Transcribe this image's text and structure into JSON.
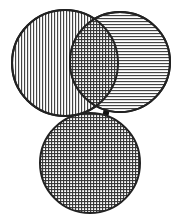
{
  "diagram": {
    "type": "venn-linked-circles",
    "colors": {
      "background": "#ffffff",
      "stroke": "#222222",
      "hatch": "#3a3a3a",
      "connector": "#111111"
    },
    "shapes": [
      {
        "id": "circle-left",
        "cx": 65,
        "cy": 63,
        "r": 53,
        "fill": "vertical-hatch"
      },
      {
        "id": "circle-right",
        "cx": 120,
        "cy": 62,
        "r": 50,
        "fill": "horizontal-hatch"
      },
      {
        "id": "circle-bottom",
        "cx": 90,
        "cy": 163,
        "r": 50,
        "fill": "cross-hatch"
      }
    ],
    "overlap": {
      "between": [
        "circle-left",
        "circle-right"
      ],
      "fill": "cross-hatch"
    },
    "connectors": [
      {
        "id": "connector-left",
        "x1": 75,
        "y1": 106,
        "x2": 77,
        "y2": 120
      },
      {
        "id": "connector-right",
        "x1": 108,
        "y1": 106,
        "x2": 104,
        "y2": 120
      }
    ]
  }
}
